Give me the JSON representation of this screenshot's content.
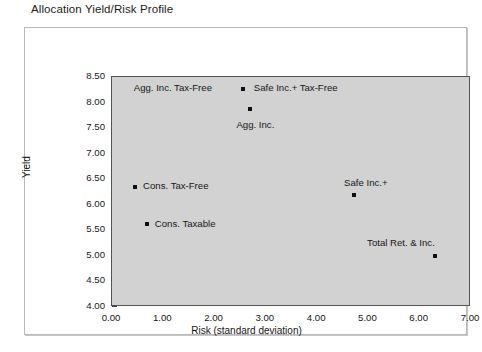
{
  "chart_data": {
    "type": "scatter",
    "title": "Allocation Yield/Risk Profile",
    "xlabel": "Risk (standard deviation)",
    "ylabel": "Yield",
    "xlim": [
      0.0,
      7.0
    ],
    "ylim": [
      4.0,
      8.5
    ],
    "grid": false,
    "legend": "none",
    "xticks": [
      "0.00",
      "1.00",
      "2.00",
      "3.00",
      "4.00",
      "5.00",
      "6.00",
      "7.00"
    ],
    "xtick_values": [
      0.0,
      1.0,
      2.0,
      3.0,
      4.0,
      5.0,
      6.0,
      7.0
    ],
    "yticks": [
      "4.00",
      "4.50",
      "5.00",
      "5.50",
      "6.00",
      "6.50",
      "7.00",
      "7.50",
      "8.00",
      "8.50"
    ],
    "ytick_values": [
      4.0,
      4.5,
      5.0,
      5.5,
      6.0,
      6.5,
      7.0,
      7.5,
      8.0,
      8.5
    ],
    "marker_color": "#101010",
    "plot_background": "#d2d2d2",
    "points": [
      {
        "label": "Agg. Inc. Tax-Free",
        "x": 2.55,
        "y": 8.27,
        "label_dx": -108,
        "label_dy": -5
      },
      {
        "label": "Safe Inc.+ Tax-Free",
        "x": 2.55,
        "y": 8.27,
        "label_dx": 12,
        "label_dy": -5
      },
      {
        "label": "Agg. Inc.",
        "x": 2.7,
        "y": 7.87,
        "label_dx": -13,
        "label_dy": 12
      },
      {
        "label": "Cons. Tax-Free",
        "x": 0.45,
        "y": 6.35,
        "label_dx": 9,
        "label_dy": -5
      },
      {
        "label": "Cons. Taxable",
        "x": 0.68,
        "y": 5.62,
        "label_dx": 9,
        "label_dy": -4
      },
      {
        "label": "Safe Inc.+",
        "x": 4.72,
        "y": 6.2,
        "label_dx": -9,
        "label_dy": -16
      },
      {
        "label": "Total Ret. & Inc.",
        "x": 6.3,
        "y": 5.0,
        "label_dx": -67,
        "label_dy": -17
      }
    ]
  }
}
